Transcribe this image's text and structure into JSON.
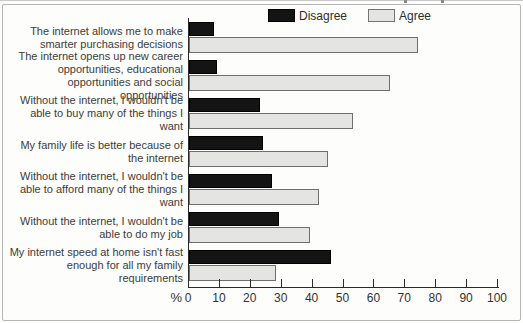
{
  "legend": {
    "disagree_label": "Disagree",
    "agree_label": "Agree"
  },
  "axis": {
    "percent_symbol": "%"
  },
  "colors": {
    "disagree_bar": "#141414",
    "agree_bar": "#e4e4e2",
    "agree_border": "#6e6e6e",
    "axis": "#2a2a2a",
    "frame_border": "#b4b4b4",
    "background": "#fdfdfb"
  },
  "chart_data": {
    "type": "bar",
    "orientation": "horizontal",
    "title": "",
    "xlabel": "%",
    "ylabel": "",
    "xlim": [
      0,
      100
    ],
    "x_ticks": [
      0,
      10,
      20,
      30,
      40,
      50,
      60,
      70,
      80,
      90,
      100
    ],
    "grid": false,
    "legend_position": "top",
    "categories": [
      "The internet allows me to make smarter purchasing decisions",
      "The internet opens up new career opportunities, educational opportunities and social opportunities",
      "Without the internet, I wouldn't be able to buy many of the things I want",
      "My family life is better because of the internet",
      "Without the internet, I wouldn't be able to afford many of the things I want",
      "Without the internet, I wouldn't be able to do my job",
      "My internet speed at home isn't fast enough for all my family requirements"
    ],
    "series": [
      {
        "name": "Disagree",
        "color": "#141414",
        "values": [
          8,
          9,
          23,
          24,
          27,
          29,
          46
        ]
      },
      {
        "name": "Agree",
        "color": "#e4e4e2",
        "values": [
          74,
          65,
          53,
          45,
          42,
          39,
          28
        ]
      }
    ]
  }
}
